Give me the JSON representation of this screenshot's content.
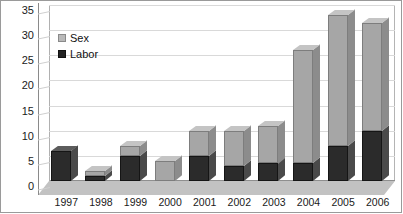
{
  "chart_data": {
    "type": "bar",
    "subtype": "stacked-column-3d",
    "title": "",
    "xlabel": "",
    "ylabel": "",
    "categories": [
      "1997",
      "1998",
      "1999",
      "2000",
      "2001",
      "2002",
      "2003",
      "2004",
      "2005",
      "2006"
    ],
    "series": [
      {
        "name": "Labor",
        "color": "#2b2b2b",
        "values": [
          6,
          1,
          5,
          0,
          5,
          3,
          3.5,
          3.5,
          7,
          10
        ]
      },
      {
        "name": "Sex",
        "color": "#a6a6a6",
        "values": [
          0,
          1,
          2,
          4,
          5,
          7,
          7.5,
          22.5,
          26,
          21.5
        ]
      }
    ],
    "totals": [
      6,
      2,
      7,
      4,
      10,
      10,
      11,
      26,
      33,
      31.5
    ],
    "ylim": [
      0,
      35
    ],
    "ytick_step": 5,
    "yticks": [
      "0",
      "5",
      "10",
      "15",
      "20",
      "25",
      "30",
      "35"
    ],
    "grid": true,
    "legend_position": "inside-top-left",
    "legend_order": [
      "Sex",
      "Labor"
    ]
  },
  "legend": {
    "sex_label": "Sex",
    "labor_label": "Labor"
  }
}
